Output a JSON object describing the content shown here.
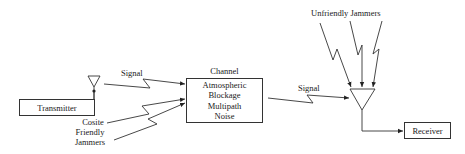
{
  "diagram": {
    "nodes": {
      "transmitter": {
        "label": "Transmitter"
      },
      "receiver": {
        "label": "Receiver"
      },
      "channel": {
        "title": "Channel",
        "effects": [
          "Atmospheric",
          "Blockage",
          "Multipath",
          "Noise"
        ]
      }
    },
    "labels": {
      "signal_in": "Signal",
      "signal_out": "Signal",
      "cosite_jammers": [
        "Cosite",
        "Friendly",
        "Jammers"
      ],
      "unfriendly_jammers": "Unfriendly Jammers"
    },
    "edges": [
      {
        "from": "transmitter",
        "to": "transmitter-antenna",
        "type": "wire"
      },
      {
        "from": "transmitter-antenna",
        "to": "channel",
        "type": "wireless",
        "label": "Signal"
      },
      {
        "from": "cosite-friendly-jammers",
        "to": "channel",
        "type": "wireless",
        "count": 2
      },
      {
        "from": "channel",
        "to": "receiver-antenna",
        "type": "wireless",
        "label": "Signal"
      },
      {
        "from": "unfriendly-jammers",
        "to": "receiver-antenna",
        "type": "wireless",
        "count": 3
      },
      {
        "from": "receiver-antenna",
        "to": "receiver",
        "type": "wire"
      }
    ],
    "colors": {
      "line": "#333333",
      "text": "#1a1a1a",
      "background": "#ffffff"
    }
  }
}
